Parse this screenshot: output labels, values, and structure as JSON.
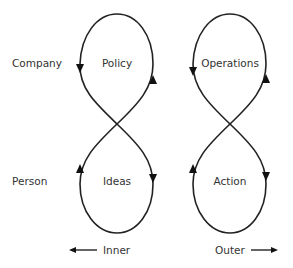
{
  "diagram": {
    "row_labels": {
      "top": "Company",
      "bottom": "Person"
    },
    "loops": {
      "inner_top": "Policy",
      "inner_bottom": "Ideas",
      "outer_top": "Operations",
      "outer_bottom": "Action"
    },
    "axis": {
      "left_label": "Inner",
      "right_label": "Outer"
    },
    "colors": {
      "stroke": "#222222",
      "text": "#333333",
      "background": "#ffffff"
    }
  }
}
